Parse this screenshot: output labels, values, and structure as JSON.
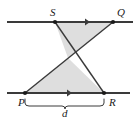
{
  "figure": {
    "type": "geometry-diagram",
    "background_color": "#ffffff",
    "line_color": "#3a3a3a",
    "shade_color": "#dedede",
    "label_color": "#1a1a1a",
    "points": [
      {
        "id": "S",
        "label": "S",
        "x": 55,
        "y": 22
      },
      {
        "id": "Q",
        "label": "Q",
        "x": 113,
        "y": 22
      },
      {
        "id": "P",
        "label": "P",
        "x": 25,
        "y": 93
      },
      {
        "id": "R",
        "label": "R",
        "x": 104,
        "y": 93
      }
    ],
    "intersection": {
      "x": 68,
      "y": 58
    },
    "parallel_lines": [
      {
        "id": "top-line",
        "x1": 7,
        "y1": 22,
        "x2": 133,
        "y2": 22,
        "tick": "arrow-right",
        "tick_x": 88
      },
      {
        "id": "bottom-line",
        "x1": 7,
        "y1": 93,
        "x2": 130,
        "y2": 93,
        "tick": "arrow-right",
        "tick_x": 70
      }
    ],
    "segments": [
      {
        "id": "segment-SR",
        "from": "S",
        "to": "R"
      },
      {
        "id": "segment-PQ",
        "from": "P",
        "to": "Q"
      }
    ],
    "shaded_regions": [
      {
        "id": "upper-triangle",
        "vertices": "S,Q,X"
      },
      {
        "id": "lower-triangle",
        "vertices": "P,R,X"
      }
    ],
    "dimension": {
      "id": "d",
      "label": "d",
      "from": "P",
      "to": "R",
      "brace_y": 101,
      "brace_x1": 25,
      "brace_x2": 104
    }
  }
}
